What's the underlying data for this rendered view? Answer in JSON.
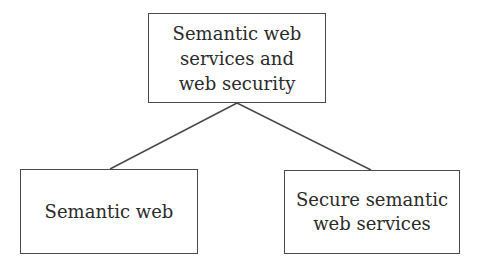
{
  "diagram": {
    "type": "tree",
    "root": {
      "id": "root",
      "label": "Semantic web\nservices  and\nweb security"
    },
    "children": [
      {
        "id": "left",
        "label": "Semantic web"
      },
      {
        "id": "right",
        "label": "Secure semantic\nweb services"
      }
    ],
    "edges": [
      {
        "from": "root",
        "to": "left"
      },
      {
        "from": "root",
        "to": "right"
      }
    ],
    "colors": {
      "stroke": "#4a4a4a",
      "text": "#2b2b2b",
      "background": "#ffffff"
    }
  }
}
